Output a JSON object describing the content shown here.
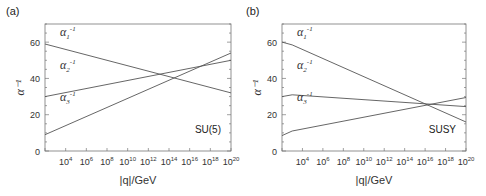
{
  "chart_data": [
    {
      "type": "line",
      "panel_label": "(a)",
      "annotation": "SU(5)",
      "title": "",
      "xlabel": "|q|/GeV",
      "ylabel": "α⁻¹",
      "xscale": "log",
      "xlim_exp": [
        2,
        20
      ],
      "ylim": [
        0,
        70
      ],
      "yticks": [
        0,
        20,
        40,
        60
      ],
      "xtick_labels": [
        "10^4",
        "10^6",
        "10^8",
        "10^10",
        "10^12",
        "10^14",
        "10^16",
        "10^18",
        "10^20"
      ],
      "grid": false,
      "series": [
        {
          "name": "α1⁻¹",
          "label_base": "α",
          "label_sub": "1",
          "label_sup": "-1",
          "x_exp": [
            2,
            20
          ],
          "y": [
            59,
            32
          ]
        },
        {
          "name": "α2⁻¹",
          "label_base": "α",
          "label_sub": "2",
          "label_sup": "-1",
          "x_exp": [
            2,
            20
          ],
          "y": [
            30,
            50
          ]
        },
        {
          "name": "α3⁻¹",
          "label_base": "α",
          "label_sub": "3",
          "label_sup": "-1",
          "x_exp": [
            2,
            20
          ],
          "y": [
            9,
            54
          ]
        }
      ]
    },
    {
      "type": "line",
      "panel_label": "(b)",
      "annotation": "SUSY",
      "title": "",
      "xlabel": "|q|/GeV",
      "ylabel": "α⁻¹",
      "xscale": "log",
      "xlim_exp": [
        2,
        20
      ],
      "ylim": [
        0,
        70
      ],
      "yticks": [
        0,
        20,
        40,
        60
      ],
      "xtick_labels": [
        "10^4",
        "10^6",
        "10^8",
        "10^10",
        "10^12",
        "10^14",
        "10^16",
        "10^18",
        "10^20"
      ],
      "grid": false,
      "series": [
        {
          "name": "α1⁻¹",
          "label_base": "α",
          "label_sub": "1",
          "label_sup": "-1",
          "x_exp": [
            2,
            3,
            20
          ],
          "y": [
            60,
            58.5,
            16
          ]
        },
        {
          "name": "α2⁻¹",
          "label_base": "α",
          "label_sub": "2",
          "label_sup": "-1",
          "x_exp": [
            2,
            3,
            20
          ],
          "y": [
            30,
            31,
            24.5
          ]
        },
        {
          "name": "α3⁻¹",
          "label_base": "α",
          "label_sub": "3",
          "label_sup": "-1",
          "x_exp": [
            2,
            3,
            20
          ],
          "y": [
            8.5,
            11,
            29.5
          ]
        }
      ]
    }
  ]
}
